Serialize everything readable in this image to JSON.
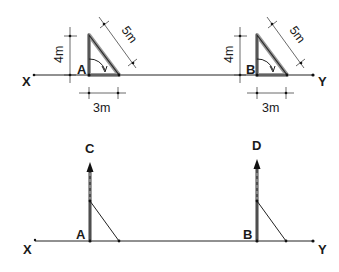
{
  "diagram": {
    "top": {
      "baseline": {
        "start_label": "X",
        "end_label": "Y"
      },
      "triangle_a": {
        "vertex_label": "A",
        "height_label": "4m",
        "base_label": "3m",
        "hypotenuse_label": "5m"
      },
      "triangle_b": {
        "vertex_label": "B",
        "height_label": "4m",
        "base_label": "3m",
        "hypotenuse_label": "5m"
      }
    },
    "bottom": {
      "baseline": {
        "start_label": "X",
        "end_label": "Y"
      },
      "perpendicular_a": {
        "base_label": "A",
        "top_label": "C"
      },
      "perpendicular_b": {
        "base_label": "B",
        "top_label": "D"
      }
    },
    "colors": {
      "line": "#222222",
      "shadow": "#9a9a9a",
      "background": "#ffffff"
    }
  }
}
